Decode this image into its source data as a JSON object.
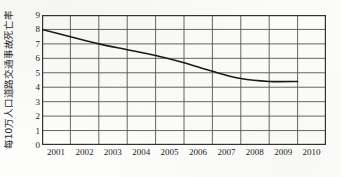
{
  "chart_data": {
    "type": "line",
    "title": "",
    "subtitle": "",
    "xlabel": "",
    "ylabel": "每10万人口道路交通事故死亡率",
    "x": [
      2001,
      2002,
      2003,
      2004,
      2005,
      2006,
      2007,
      2008,
      2009,
      2010
    ],
    "xtick_labels": [
      "2001",
      "2002",
      "2003",
      "2004",
      "2005",
      "2006",
      "2007",
      "2008",
      "2009",
      "2010"
    ],
    "ytick_labels": [
      "0",
      "1",
      "2",
      "3",
      "4",
      "5",
      "6",
      "7",
      "8",
      "9"
    ],
    "yticks": [
      0,
      1,
      2,
      3,
      4,
      5,
      6,
      7,
      8,
      9
    ],
    "ylim": [
      0,
      9
    ],
    "xlim": [
      2001,
      2011
    ],
    "grid": true,
    "legend": false,
    "legend_position": "none",
    "line_color": "#1a1a1a",
    "grid_color": "#555555",
    "frame_color": "#333333",
    "background_color": "#fdfdfb",
    "series": [
      {
        "name": "每10万人口道路交通事故死亡率",
        "values": [
          8.0,
          7.5,
          7.0,
          6.6,
          6.2,
          5.7,
          5.1,
          4.6,
          4.4,
          4.4
        ]
      }
    ],
    "annotations": []
  }
}
